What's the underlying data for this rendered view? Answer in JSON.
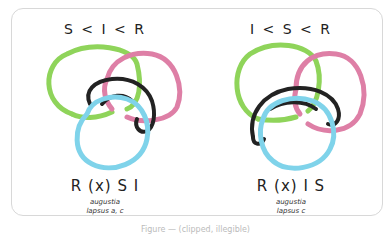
{
  "figure": {
    "caption": "Figure — (clipped, illegible)",
    "colors": {
      "green": "#8fd45a",
      "pink": "#de7fa6",
      "blue": "#7fd3ea",
      "black": "#222222",
      "frame": "#d8d8d8"
    },
    "panels": [
      {
        "order_label": "S < I < R",
        "knot_name": "R (x) S I",
        "sub_line_1": "augustia",
        "sub_line_2": "lapsus a, c",
        "strands": [
          "green",
          "pink",
          "black",
          "blue"
        ]
      },
      {
        "order_label": "I < S < R",
        "knot_name": "R (x) I S",
        "sub_line_1": "augustia",
        "sub_line_2": "lapsus c",
        "strands": [
          "green",
          "pink",
          "black",
          "blue"
        ]
      }
    ]
  }
}
